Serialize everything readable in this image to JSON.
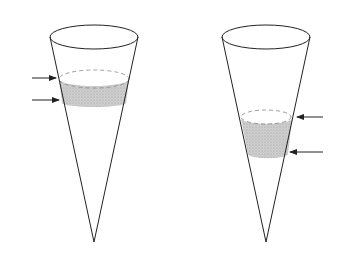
{
  "diagram": {
    "colors": {
      "stroke": "#222222",
      "band_fill": "#c8c8c8",
      "background": "#ffffff"
    },
    "cones": [
      {
        "id": "left",
        "band_position": "upper",
        "arrows_side": "left",
        "arrow_count": 2
      },
      {
        "id": "right",
        "band_position": "lower",
        "arrows_side": "right",
        "arrow_count": 2
      }
    ]
  }
}
